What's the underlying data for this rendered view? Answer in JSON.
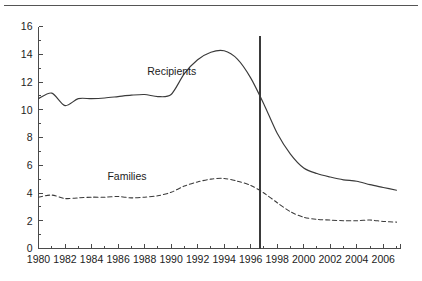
{
  "figure": {
    "has_top_rule": true,
    "background_color": "#ffffff",
    "line_color": "#3a3a3a",
    "axis_color": "#4a4a4a"
  },
  "chart_data": {
    "type": "line",
    "title": "",
    "subtitle": "",
    "xlabel": "",
    "ylabel": "",
    "xlim": [
      1980,
      2007.3
    ],
    "ylim": [
      0,
      16
    ],
    "grid": false,
    "legend_position": "inline-annotation",
    "y_ticks": [
      0,
      2,
      4,
      6,
      8,
      10,
      12,
      14,
      16
    ],
    "y_tick_labels": [
      "0",
      "2",
      "4",
      "6",
      "8",
      "10",
      "12",
      "14",
      "16"
    ],
    "y_minor_ticks": [
      1,
      3,
      5,
      7,
      9,
      11,
      13,
      15
    ],
    "x_ticks": [
      1980,
      1981,
      1982,
      1983,
      1984,
      1985,
      1986,
      1987,
      1988,
      1989,
      1990,
      1991,
      1992,
      1993,
      1994,
      1995,
      1996,
      1997,
      1998,
      1999,
      2000,
      2001,
      2002,
      2003,
      2004,
      2005,
      2006,
      2007
    ],
    "x_tick_labels": [
      "1980",
      "1982",
      "1984",
      "1986",
      "1988",
      "1990",
      "1992",
      "1994",
      "1996",
      "1998",
      "2000",
      "2002",
      "2004",
      "2006"
    ],
    "x_labeled_ticks": [
      1980,
      1982,
      1984,
      1986,
      1988,
      1990,
      1992,
      1994,
      1996,
      1998,
      2000,
      2002,
      2004,
      2006
    ],
    "x": [
      1980,
      1981,
      1982,
      1983,
      1984,
      1985,
      1986,
      1987,
      1988,
      1989,
      1990,
      1991,
      1992,
      1993,
      1994,
      1995,
      1996,
      1997,
      1998,
      1999,
      2000,
      2001,
      2002,
      2003,
      2004,
      2005,
      2006,
      2007
    ],
    "series": [
      {
        "name": "Recipients",
        "style": "solid",
        "label": "Recipients",
        "values": [
          10.8,
          11.2,
          10.3,
          10.8,
          10.8,
          10.85,
          10.95,
          11.05,
          11.1,
          10.95,
          11.1,
          12.6,
          13.6,
          14.15,
          14.25,
          13.65,
          12.3,
          10.4,
          8.3,
          6.8,
          5.8,
          5.4,
          5.15,
          4.95,
          4.85,
          4.6,
          4.4,
          4.2
        ],
        "annotation": {
          "text": "Recipients",
          "x": 1988.2,
          "y": 12.5
        }
      },
      {
        "name": "Families",
        "style": "dashed",
        "label": "Families",
        "values": [
          3.7,
          3.85,
          3.6,
          3.65,
          3.7,
          3.7,
          3.75,
          3.65,
          3.7,
          3.8,
          4.05,
          4.5,
          4.8,
          5.0,
          5.05,
          4.85,
          4.55,
          4.0,
          3.3,
          2.65,
          2.25,
          2.1,
          2.05,
          2.0,
          2.0,
          2.05,
          1.95,
          1.9
        ],
        "annotation": {
          "text": "Families",
          "x": 1985.2,
          "y": 4.95
        }
      }
    ],
    "reference_lines": [
      {
        "name": "welfare-reform-marker",
        "orientation": "vertical",
        "x": 1996.7,
        "y_from": 0,
        "y_to": 15.3
      }
    ]
  }
}
